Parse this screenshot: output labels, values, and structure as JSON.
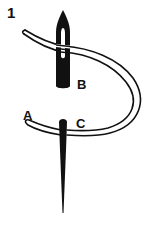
{
  "figure": {
    "step_number": "1",
    "labels": {
      "a": "A",
      "b": "B",
      "c": "C"
    },
    "elements": [
      {
        "name": "needle-eye-end",
        "label_ref": "B",
        "description": "needle eye with thread passing through"
      },
      {
        "name": "needle-point-end",
        "label_ref": "C",
        "description": "needle shaft pointing downward"
      },
      {
        "name": "thread",
        "label_ref": "A",
        "description": "curved thread loop from A around to the needle eye"
      }
    ],
    "colors": {
      "ink": "#111111",
      "background": "#ffffff"
    }
  }
}
